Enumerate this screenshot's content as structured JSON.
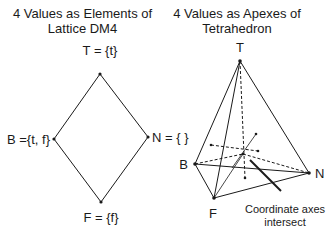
{
  "left_panel": {
    "title_line1": "4 Values as Elements of",
    "title_line2": "Lattice DM4",
    "nodes": {
      "top": "T = {t}",
      "left": "B ={t, f}",
      "right": "N = { }",
      "bottom": "F = {f}"
    }
  },
  "right_panel": {
    "title_line1": "4 Values as Apexes of",
    "title_line2": "Tetrahedron",
    "vertices": {
      "top": "T",
      "left": "B",
      "right": "N",
      "bottom": "F"
    },
    "annotation_line1": "Coordinate axes",
    "annotation_line2": "intersect"
  },
  "colors": {
    "line": "#1a1a1a",
    "background": "#ffffff"
  }
}
